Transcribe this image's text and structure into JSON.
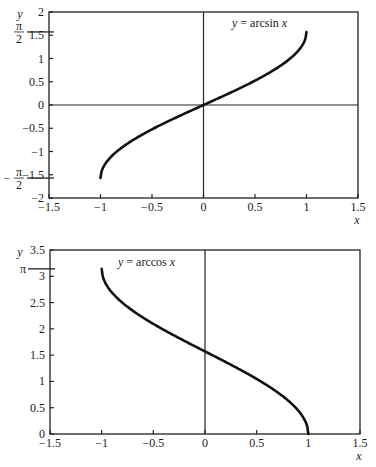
{
  "chart_data": [
    {
      "type": "line",
      "title": "",
      "annotation": "y = arcsin x",
      "annotation_parts": {
        "y": "y",
        "eq": " = arcsin ",
        "x": "x"
      },
      "xlabel": "x",
      "ylabel": "y",
      "xlim": [
        -1.5,
        1.5
      ],
      "ylim": [
        -2,
        2
      ],
      "xticks": [
        -1.5,
        -1,
        -0.5,
        0,
        0.5,
        1,
        1.5
      ],
      "xtick_labels": [
        "−1.5",
        "−1",
        "−0.5",
        "0",
        "0.5",
        "1",
        "1.5"
      ],
      "yticks": [
        -2,
        -1.5,
        -1,
        -0.5,
        0,
        0.5,
        1,
        1.5,
        2
      ],
      "ytick_labels": [
        "−2",
        "−1.5",
        "−1",
        "−0.5",
        "0",
        "0.5",
        "1",
        "1.5",
        "2"
      ],
      "special_ticks": [
        {
          "value": 1.5708,
          "label": "π/2"
        },
        {
          "value": -1.5708,
          "label": "−π/2"
        }
      ],
      "grid": false,
      "series": [
        {
          "name": "arcsin x",
          "x": [
            -1,
            -0.9,
            -0.75,
            -0.5,
            -0.25,
            0,
            0.25,
            0.5,
            0.75,
            0.9,
            1
          ],
          "y": [
            -1.5708,
            -1.1198,
            -0.8481,
            -0.5236,
            -0.2527,
            0,
            0.2527,
            0.5236,
            0.8481,
            1.1198,
            1.5708
          ]
        }
      ]
    },
    {
      "type": "line",
      "title": "",
      "annotation": "y = arccos x",
      "annotation_parts": {
        "y": "y",
        "eq": " = arccos ",
        "x": "x"
      },
      "xlabel": "x",
      "ylabel": "y",
      "xlim": [
        -1.5,
        1.5
      ],
      "ylim": [
        0,
        3.5
      ],
      "xticks": [
        -1.5,
        -1,
        -0.5,
        0,
        0.5,
        1,
        1.5
      ],
      "xtick_labels": [
        "−1.5",
        "−1",
        "−0.5",
        "0",
        "0.5",
        "1",
        "1.5"
      ],
      "yticks": [
        0,
        0.5,
        1,
        1.5,
        2,
        2.5,
        3,
        3.5
      ],
      "ytick_labels": [
        "0",
        "0.5",
        "1",
        "1.5",
        "2",
        "2.5",
        "3",
        "3.5"
      ],
      "special_ticks": [
        {
          "value": 3.1416,
          "label": "π"
        }
      ],
      "grid": false,
      "series": [
        {
          "name": "arccos x",
          "x": [
            -1,
            -0.9,
            -0.75,
            -0.5,
            -0.25,
            0,
            0.25,
            0.5,
            0.75,
            0.9,
            1
          ],
          "y": [
            3.1416,
            2.6906,
            2.4189,
            2.0944,
            1.8235,
            1.5708,
            1.3181,
            1.0472,
            0.7227,
            0.451,
            0
          ]
        }
      ]
    }
  ]
}
